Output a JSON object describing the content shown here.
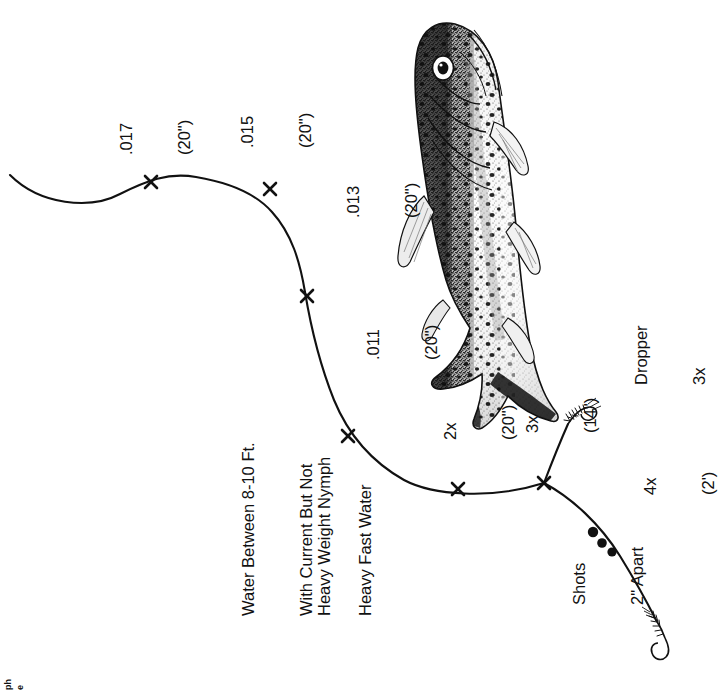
{
  "diagram": {
    "line_color": "#111111",
    "background": "#ffffff"
  },
  "tippet_labels": [
    {
      "name": "butt-017",
      "size": ".017",
      "length": "(20\")"
    },
    {
      "name": "seg-015",
      "size": ".015",
      "length": "(20\")"
    },
    {
      "name": "seg-013",
      "size": ".013",
      "length": "(20\")"
    },
    {
      "name": "seg-011",
      "size": ".011",
      "length": "(20\")"
    },
    {
      "name": "seg-2x",
      "size": "2x",
      "length": "(20\")"
    },
    {
      "name": "seg-3x",
      "size": "3x",
      "length": "(14\")"
    },
    {
      "name": "seg-4x",
      "size": "4x",
      "length": "(2')"
    }
  ],
  "callouts": {
    "dropper": {
      "line1": "Dropper",
      "line2": "3x"
    },
    "shots": {
      "line1": "Shots",
      "line2": "2\" Apart"
    }
  },
  "description_block": {
    "lines": [
      "Water Between 8-10 Ft.",
      "With Current But Not",
      "Heavy Fast Water"
    ],
    "fly_line": "Heavy Weight Nymph"
  },
  "edge_column": {
    "chars": [
      "ph",
      "e",
      "ns",
      "ty",
      "an",
      "re",
      "ck",
      "lo",
      "y",
      "e",
      "g:",
      "ir-",
      "'s",
      "er"
    ]
  },
  "illustration": {
    "subject": "trout-illustration"
  }
}
